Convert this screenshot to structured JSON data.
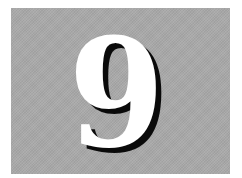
{
  "panel": {
    "digit": "9",
    "background_color": "#a9a9a9",
    "digit_color": "#ffffff",
    "shadow_color": "#0a0a0a"
  }
}
